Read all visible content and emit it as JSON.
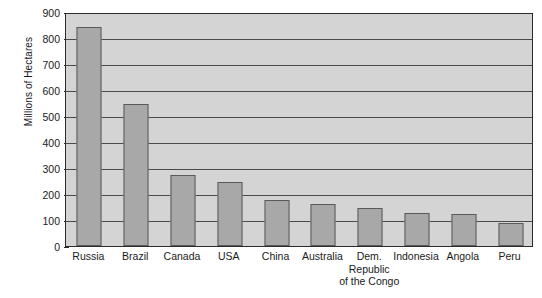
{
  "chart_data": {
    "type": "bar",
    "title": "",
    "xlabel": "",
    "ylabel": "Millions of Hectares",
    "ylim": [
      0,
      900
    ],
    "ytick_step": 100,
    "yticks": [
      900,
      800,
      700,
      600,
      500,
      400,
      300,
      200,
      100,
      0
    ],
    "grid": true,
    "legend": "none",
    "categories": [
      "Russia",
      "Brazil",
      "Canada",
      "USA",
      "China",
      "Australia",
      "Dem. Republic of the Congo",
      "Indonesia",
      "Angola",
      "Peru"
    ],
    "category_lines": [
      [
        "Russia"
      ],
      [
        "Brazil"
      ],
      [
        "Canada"
      ],
      [
        "USA"
      ],
      [
        "China"
      ],
      [
        "Australia"
      ],
      [
        "Dem.",
        "Republic",
        "of the Congo"
      ],
      [
        "Indonesia"
      ],
      [
        "Angola"
      ],
      [
        "Peru"
      ]
    ],
    "values": [
      855,
      555,
      275,
      250,
      180,
      165,
      148,
      130,
      125,
      88
    ],
    "colors": {
      "bar_fill": "#a8a8a8",
      "bar_stroke": "#5a5a5a",
      "plot_background": "#d4d4d4",
      "gridline": "#4a4a4a",
      "axis": "#2b2b2b",
      "text": "#1a1a1a",
      "page_background": "#ffffff"
    }
  }
}
